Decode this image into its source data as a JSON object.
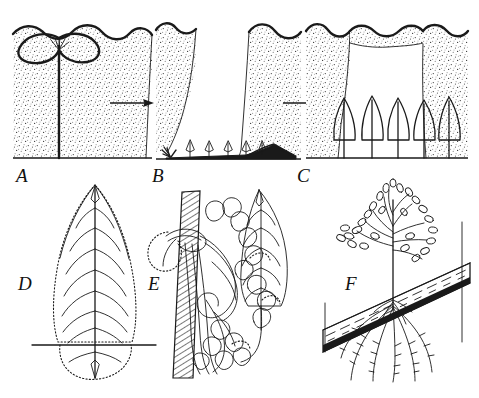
{
  "figure": {
    "background_color": "#ffffff",
    "ink_color": "#1a1a1a",
    "width": 479,
    "height": 398,
    "caption": ""
  },
  "panels": [
    {
      "id": "A",
      "label": "A",
      "label_x": 16,
      "label_y": 182,
      "name": "mature-canopy-tree-panel",
      "description": "Mature emergent tree with wide umbrella crown standing within a closed forest canopy shown in stipple",
      "elements": {
        "canopy": "closed stippled forest canopy with scalloped upper margin",
        "tree": "single tall tree with straight slender trunk and broad flattened umbrella-shaped crown",
        "ground": "horizontal ground line at base"
      }
    },
    {
      "id": "B",
      "label": "B",
      "label_x": 152,
      "label_y": 182,
      "name": "treefall-gap-panel",
      "description": "The tree has fallen leaving a gap in the canopy; the fallen trunk lies on the forest floor and small seedlings sprout along the gap",
      "elements": {
        "canopy": "stippled canopy walls on left and right with open gap between",
        "fallen_log": "dark horizontal fallen trunk with root mass at left and crown debris at right",
        "seedlings": "four small upright seedlings emerging from the forest floor",
        "seedling_count": 4
      }
    },
    {
      "id": "C",
      "label": "C",
      "label_x": 297,
      "label_y": 182,
      "name": "gap-regeneration-panel",
      "description": "Gap-phase regeneration: a cohort of young saplings with conical crowns fills the canopy opening",
      "elements": {
        "canopy": "stippled canopy walls framing a wide bell-shaped gap",
        "saplings": "five young saplings with narrow conical crowns and straight stems",
        "sapling_count": 5
      }
    },
    {
      "id": "D",
      "label": "D",
      "label_x": 18,
      "label_y": 290,
      "name": "leaf-morphology-panel",
      "description": "Single elongate leaf with prominent midrib and pinnate secondary veins; dotted outline marks the lamina margin and a basal extension below the horizontal reference line",
      "elements": {
        "lamina": "ovate-lanceolate blade with dotted margin",
        "midrib": "strong straight central midrib running the full length",
        "veins": "roughly nine pairs of curved pinnate lateral veins",
        "reference_line": "horizontal line crossing the leaf base",
        "basal_lobe": "dotted rounded extension below the reference line"
      }
    },
    {
      "id": "E",
      "label": "E",
      "label_x": 148,
      "label_y": 290,
      "name": "epiphyte-climber-panel",
      "description": "Climbing epiphytic plant clasping a hatched vertical tree trunk, with looping stems, rounded leaflets and an erect lanceolate frond",
      "elements": {
        "host_trunk": "vertical tree trunk rendered in diagonal hatching",
        "clasping_stems": "long looping stems wrapping and hanging from the trunk",
        "foliage": "clusters of small rounded and lobed leaflets",
        "frond": "erect lanceolate frond with midrib and lateral veins at the right"
      }
    },
    {
      "id": "F",
      "label": "F",
      "label_x": 345,
      "label_y": 290,
      "name": "epiphytic-shrub-on-branch-panel",
      "description": "Small branching shrub established on a horizontal inclined bough, sending aerial roots downward along and past the branch",
      "elements": {
        "host_branch": "thick inclined branch with longitudinal striations and dark bark shading",
        "shrub": "slender upright stem with spreading branches bearing many small leaves",
        "aerial_roots": "five to six descending aerial roots with fine lateral rootlets",
        "vertical_line": "thin vertical reference line at right"
      }
    }
  ],
  "arrows": [
    {
      "name": "arrow-a-to-b",
      "from_panel": "A",
      "to_panel": "B",
      "direction": "right",
      "x1": 110,
      "x2": 148,
      "y": 103
    },
    {
      "name": "arrow-b-to-c",
      "from_panel": "B",
      "to_panel": "C",
      "direction": "right",
      "x1": 283,
      "x2": 322,
      "y": 103
    }
  ],
  "colors": {
    "ink": "#1a1a1a",
    "paper": "#ffffff",
    "stipple": "#3a3a3a",
    "hatch": "#2a2a2a"
  }
}
